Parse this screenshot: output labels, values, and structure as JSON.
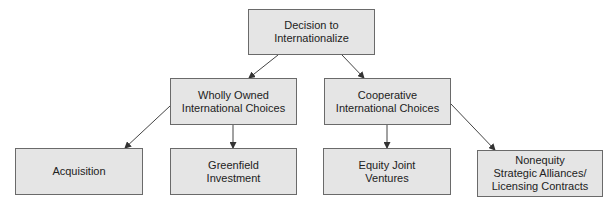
{
  "diagram": {
    "type": "tree",
    "nodes": [
      {
        "id": "root",
        "label": "Decision to\nInternationalize"
      },
      {
        "id": "wholly",
        "label": "Wholly Owned\nInternational Choices"
      },
      {
        "id": "coop",
        "label": "Cooperative\nInternational Choices"
      },
      {
        "id": "acq",
        "label": "Acquisition"
      },
      {
        "id": "green",
        "label": "Greenfield\nInvestment"
      },
      {
        "id": "ejv",
        "label": "Equity Joint\nVentures"
      },
      {
        "id": "nonequity",
        "label": "Nonequity\nStrategic Alliances/\nLicensing Contracts"
      }
    ],
    "edges": [
      {
        "from": "root",
        "to": "wholly"
      },
      {
        "from": "root",
        "to": "coop"
      },
      {
        "from": "wholly",
        "to": "acq"
      },
      {
        "from": "wholly",
        "to": "green"
      },
      {
        "from": "coop",
        "to": "ejv"
      },
      {
        "from": "coop",
        "to": "nonequity"
      }
    ],
    "colors": {
      "box_fill": "#e5e5e5",
      "box_border": "#6a6a6a",
      "line": "#444444"
    }
  }
}
